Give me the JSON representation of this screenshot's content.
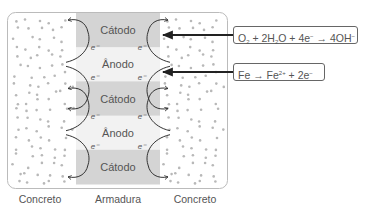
{
  "bands": [
    {
      "label": "Cátodo",
      "type": "cathode"
    },
    {
      "label": "Ânodo",
      "type": "anode"
    },
    {
      "label": "Cátodo",
      "type": "cathode"
    },
    {
      "label": "Ânodo",
      "type": "anode"
    },
    {
      "label": "Cátodo",
      "type": "cathode"
    }
  ],
  "electron_label": "e⁻",
  "equations": {
    "cathode": {
      "parts": [
        "O",
        "2",
        " + 2H",
        "2",
        "O + 4e",
        "−",
        " → 4OH",
        "−"
      ]
    },
    "anode": {
      "parts": [
        "Fe → Fe",
        "2+",
        " + 2e",
        "−"
      ]
    }
  },
  "bottom_labels": {
    "left": "Concreto",
    "center": "Armadura",
    "right": "Concreto"
  },
  "colors": {
    "cathode_band": "#d4d4d4",
    "anode_band": "#f2f2f2",
    "dots": "#b8b8b8",
    "border": "#bbbbbb",
    "arrow": "#222222"
  }
}
